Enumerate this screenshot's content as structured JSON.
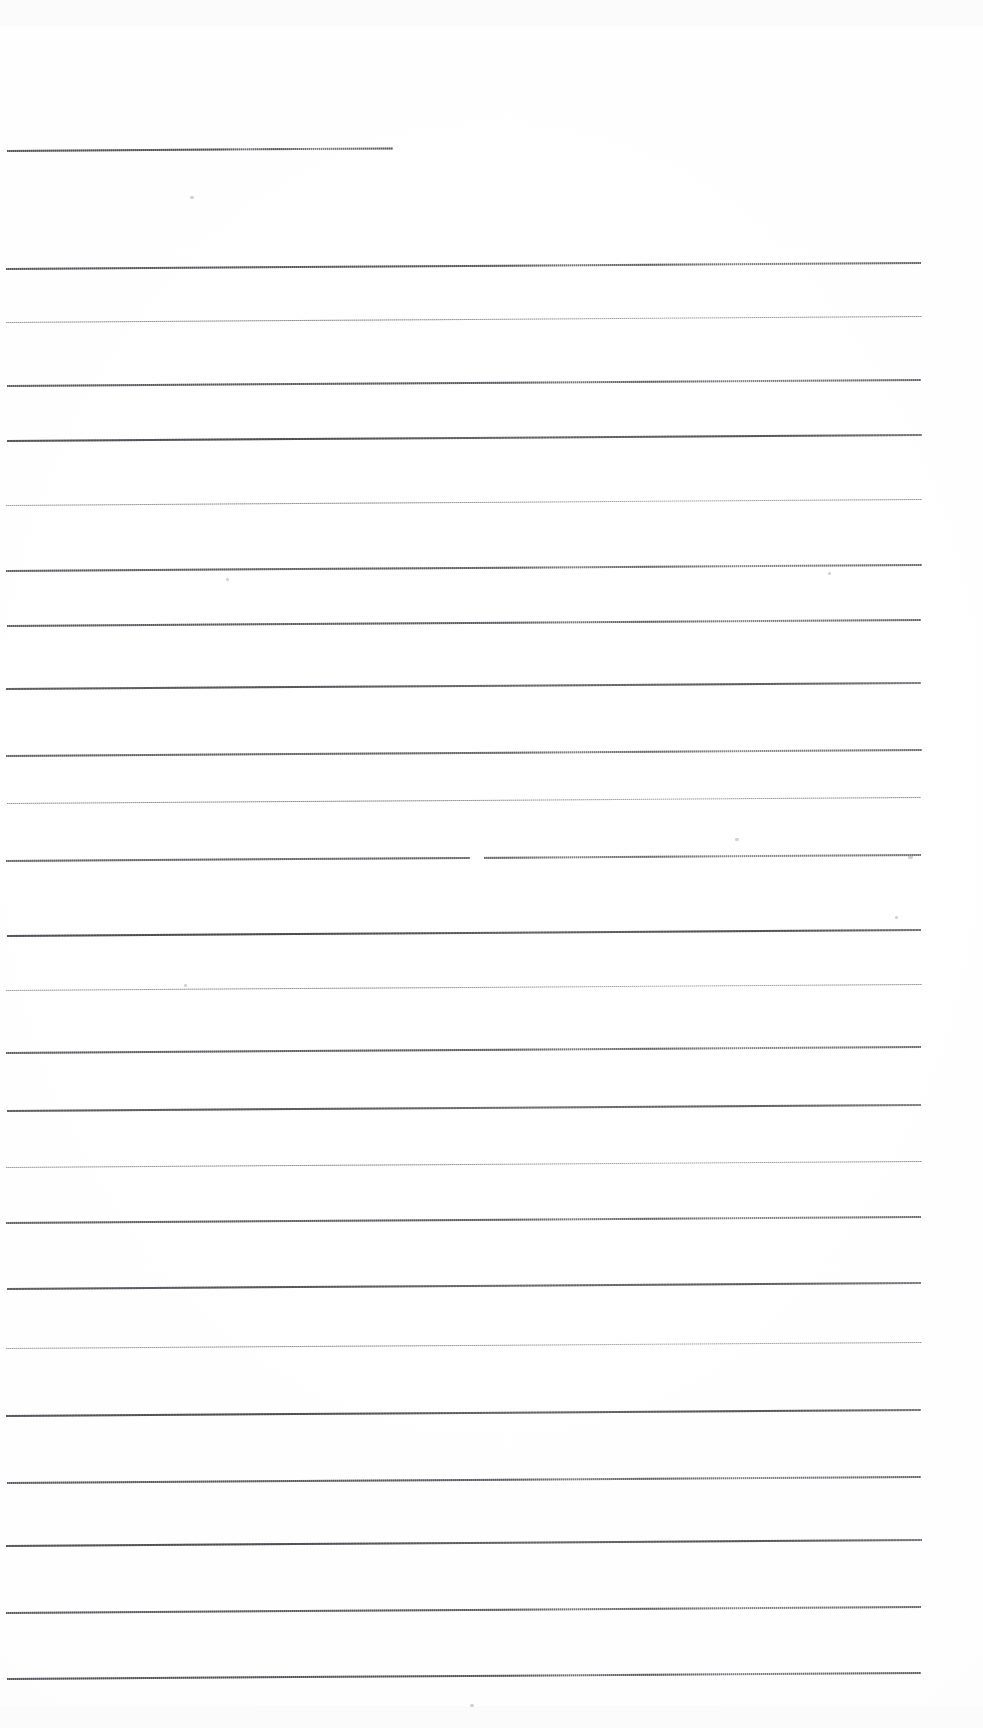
{
  "document": {
    "kind": "scanned-ruled-paper",
    "title": "Blank ruled page scan",
    "page_width": 983,
    "page_height": 1728,
    "background_color": "#ffffff",
    "ink_color": "#56565f",
    "visible_text": "",
    "note": "No handwriting, printed text, headings or numbers are visible on the page."
  },
  "ruling": {
    "line_count": 24,
    "nominal_spacing_px": 66,
    "left_margin_px": 7,
    "right_edge_px": 921,
    "skew_description": "lines rise slightly toward the right",
    "skew_deg": -0.38,
    "first_line_is_short": true,
    "first_line_right_edge_px": 393
  },
  "lines": [
    {
      "index": 1,
      "y": 150,
      "x": 7,
      "width": 386,
      "thickness": 1.6,
      "texture": "dotted",
      "opacity": 0.8
    },
    {
      "index": 2,
      "y": 268,
      "x": 6,
      "width": 915,
      "thickness": 1.5,
      "texture": "dotted",
      "opacity": 0.78
    },
    {
      "index": 3,
      "y": 322,
      "x": 6,
      "width": 916,
      "thickness": 1.4,
      "texture": "faint",
      "opacity": 0.6
    },
    {
      "index": 4,
      "y": 385,
      "x": 7,
      "width": 914,
      "thickness": 1.5,
      "texture": "dotted",
      "opacity": 0.76
    },
    {
      "index": 5,
      "y": 440,
      "x": 7,
      "width": 915,
      "thickness": 1.7,
      "texture": "solid",
      "opacity": 0.88
    },
    {
      "index": 6,
      "y": 505,
      "x": 6,
      "width": 916,
      "thickness": 1.4,
      "texture": "faint",
      "opacity": 0.58
    },
    {
      "index": 7,
      "y": 570,
      "x": 6,
      "width": 916,
      "thickness": 1.5,
      "texture": "dotted",
      "opacity": 0.74
    },
    {
      "index": 8,
      "y": 625,
      "x": 7,
      "width": 914,
      "thickness": 1.5,
      "texture": "dotted",
      "opacity": 0.76
    },
    {
      "index": 9,
      "y": 688,
      "x": 6,
      "width": 915,
      "thickness": 1.6,
      "texture": "solid",
      "opacity": 0.84
    },
    {
      "index": 10,
      "y": 755,
      "x": 6,
      "width": 916,
      "thickness": 1.5,
      "texture": "dotted",
      "opacity": 0.72
    },
    {
      "index": 11,
      "y": 803,
      "x": 7,
      "width": 914,
      "thickness": 1.4,
      "texture": "faint",
      "opacity": 0.6
    },
    {
      "index": 12,
      "y": 860,
      "x": 6,
      "width": 915,
      "thickness": 1.5,
      "texture": "dotted",
      "opacity": 0.7
    },
    {
      "index": 13,
      "y": 935,
      "x": 7,
      "width": 914,
      "thickness": 1.8,
      "texture": "solid",
      "opacity": 0.9
    },
    {
      "index": 14,
      "y": 990,
      "x": 6,
      "width": 916,
      "thickness": 1.4,
      "texture": "faint",
      "opacity": 0.56
    },
    {
      "index": 15,
      "y": 1052,
      "x": 6,
      "width": 915,
      "thickness": 1.5,
      "texture": "dotted",
      "opacity": 0.74
    },
    {
      "index": 16,
      "y": 1110,
      "x": 7,
      "width": 914,
      "thickness": 1.6,
      "texture": "solid",
      "opacity": 0.82
    },
    {
      "index": 17,
      "y": 1167,
      "x": 6,
      "width": 916,
      "thickness": 1.4,
      "texture": "faint",
      "opacity": 0.58
    },
    {
      "index": 18,
      "y": 1222,
      "x": 6,
      "width": 915,
      "thickness": 1.5,
      "texture": "dotted",
      "opacity": 0.74
    },
    {
      "index": 19,
      "y": 1288,
      "x": 7,
      "width": 914,
      "thickness": 1.6,
      "texture": "solid",
      "opacity": 0.84
    },
    {
      "index": 20,
      "y": 1348,
      "x": 6,
      "width": 916,
      "thickness": 1.4,
      "texture": "faint",
      "opacity": 0.56
    },
    {
      "index": 21,
      "y": 1415,
      "x": 6,
      "width": 915,
      "thickness": 1.7,
      "texture": "solid",
      "opacity": 0.88
    },
    {
      "index": 22,
      "y": 1482,
      "x": 7,
      "width": 914,
      "thickness": 1.5,
      "texture": "dotted",
      "opacity": 0.76
    },
    {
      "index": 23,
      "y": 1545,
      "x": 6,
      "width": 916,
      "thickness": 1.7,
      "texture": "solid",
      "opacity": 0.88
    },
    {
      "index": 24,
      "y": 1612,
      "x": 6,
      "width": 915,
      "thickness": 1.5,
      "texture": "dotted",
      "opacity": 0.76
    },
    {
      "index": 25,
      "y": 1678,
      "x": 7,
      "width": 914,
      "thickness": 1.6,
      "texture": "dotted",
      "opacity": 0.8
    }
  ],
  "marks": [
    {
      "name": "speck-upper-left",
      "x": 190,
      "y": 196,
      "w": 4,
      "h": 3
    },
    {
      "name": "speck-mid-left",
      "x": 226,
      "y": 578,
      "w": 3,
      "h": 3
    },
    {
      "name": "speck-right-edge",
      "x": 828,
      "y": 572,
      "w": 3,
      "h": 3
    },
    {
      "name": "speck-near-rule-13",
      "x": 908,
      "y": 855,
      "w": 5,
      "h": 4
    },
    {
      "name": "speck-right-upper",
      "x": 895,
      "y": 916,
      "w": 3,
      "h": 3
    },
    {
      "name": "speck-mid-low",
      "x": 735,
      "y": 838,
      "w": 4,
      "h": 3
    },
    {
      "name": "speck-left-low",
      "x": 184,
      "y": 984,
      "w": 3,
      "h": 3
    },
    {
      "name": "speck-bottom",
      "x": 470,
      "y": 1704,
      "w": 4,
      "h": 3
    }
  ],
  "gaps": [
    {
      "name": "gap-rule-13",
      "x": 797,
      "y": 932,
      "w": 9,
      "h": 4
    },
    {
      "name": "gap-rule-12",
      "x": 470,
      "y": 856,
      "w": 14,
      "h": 4
    }
  ],
  "artifacts": [
    {
      "name": "scan-band-top",
      "x": 0,
      "y": 0,
      "w": 983,
      "h": 26
    },
    {
      "name": "scan-band-bottom",
      "x": 0,
      "y": 1706,
      "w": 983,
      "h": 22
    }
  ]
}
